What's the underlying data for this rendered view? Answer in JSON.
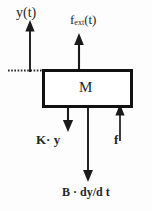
{
  "diagram": {
    "type": "free-body-diagram",
    "background_color": "#fdfdfd",
    "stroke_color": "#1a1a1a",
    "box": {
      "label": "M",
      "border_color": "#111111",
      "fill_color": "#ffffff"
    },
    "labels": {
      "displacement": "y(t)",
      "external_force_base": "f",
      "external_force_sub": "ext",
      "external_force_tail": "(t)",
      "spring_force": "K· y",
      "reaction_force": "f",
      "damping_force": "B · dy/d t"
    },
    "arrows": [
      {
        "name": "displacement-arrow",
        "label": "y(t)",
        "direction": "up",
        "x": 30,
        "from_y": 72,
        "to_y": 22
      },
      {
        "name": "external-force-arrow",
        "label": "f_ext(t)",
        "direction": "up",
        "x": 79,
        "from_y": 70,
        "to_y": 34
      },
      {
        "name": "spring-force-arrow",
        "label": "K· y",
        "direction": "down",
        "x": 68,
        "from_y": 107,
        "to_y": 131
      },
      {
        "name": "damping-force-arrow",
        "label": "B · dy/d t",
        "direction": "down",
        "x": 88,
        "from_y": 107,
        "to_y": 181
      },
      {
        "name": "reaction-force-arrow",
        "label": "f",
        "direction": "up",
        "x": 120,
        "from_y": 141,
        "to_y": 107
      }
    ],
    "reference_line": {
      "name": "reference-datum-line",
      "style": "dotted",
      "y": 70,
      "from_x": 8,
      "to_x": 42
    }
  }
}
